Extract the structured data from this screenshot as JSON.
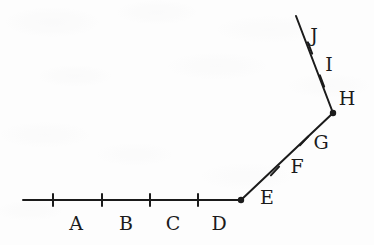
{
  "figure": {
    "type": "geometry-number-line-diagram",
    "canvas": {
      "width": 374,
      "height": 245
    },
    "background_color": "#fdfdfd",
    "stroke_color": "#1b1b1b",
    "stroke_width": 2,
    "tick_length": 12,
    "vertex_dot_radius": 3.2
  },
  "path": {
    "description": "A polyline of three straight segments: a horizontal ray, a diagonal rising to the right, and a steeper segment rising to the left.",
    "vertices": [
      {
        "name": "left-end",
        "x": 23,
        "y": 200,
        "dot": false
      },
      {
        "name": "corner-one",
        "x": 241,
        "y": 200,
        "dot": true
      },
      {
        "name": "corner-two",
        "x": 333,
        "y": 113,
        "dot": true
      },
      {
        "name": "top-end",
        "x": 296,
        "y": 16,
        "dot": false
      }
    ],
    "segments": [
      {
        "name": "horizontal-segment",
        "from": [
          23,
          200
        ],
        "to": [
          241,
          200
        ]
      },
      {
        "name": "diagonal-segment",
        "from": [
          241,
          200
        ],
        "to": [
          333,
          113
        ]
      },
      {
        "name": "upper-segment",
        "from": [
          333,
          113
        ],
        "to": [
          296,
          16
        ]
      }
    ]
  },
  "ticks": [
    {
      "name": "tick-1",
      "x": 53,
      "y": 200,
      "angle_deg": 0
    },
    {
      "name": "tick-2",
      "x": 102,
      "y": 200,
      "angle_deg": 0
    },
    {
      "name": "tick-3",
      "x": 150,
      "y": 200,
      "angle_deg": 0
    },
    {
      "name": "tick-4",
      "x": 198,
      "y": 200,
      "angle_deg": 0
    },
    {
      "name": "tick-5",
      "x": 275,
      "y": 171,
      "angle_deg": -43
    },
    {
      "name": "tick-6",
      "x": 304,
      "y": 141,
      "angle_deg": -43
    },
    {
      "name": "tick-7",
      "x": 322,
      "y": 81,
      "angle_deg": 21
    },
    {
      "name": "tick-8",
      "x": 310,
      "y": 48,
      "angle_deg": 21
    }
  ],
  "labels": [
    {
      "id": "A",
      "text": "A",
      "x": 76,
      "y": 223
    },
    {
      "id": "B",
      "text": "B",
      "x": 126,
      "y": 223
    },
    {
      "id": "C",
      "text": "C",
      "x": 173,
      "y": 223
    },
    {
      "id": "D",
      "text": "D",
      "x": 219,
      "y": 223
    },
    {
      "id": "E",
      "text": "E",
      "x": 267,
      "y": 197
    },
    {
      "id": "F",
      "text": "F",
      "x": 297,
      "y": 166
    },
    {
      "id": "G",
      "text": "G",
      "x": 321,
      "y": 142
    },
    {
      "id": "H",
      "text": "H",
      "x": 347,
      "y": 98
    },
    {
      "id": "I",
      "text": "I",
      "x": 329,
      "y": 64
    },
    {
      "id": "J",
      "text": "J",
      "x": 314,
      "y": 35
    }
  ]
}
